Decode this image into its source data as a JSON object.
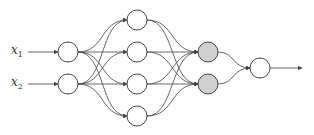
{
  "diagram": {
    "type": "neural-network",
    "inputs": [
      {
        "var": "x",
        "sub": "1"
      },
      {
        "var": "x",
        "sub": "2"
      }
    ],
    "layers": [
      {
        "name": "input",
        "count": 2,
        "fill": "#ffffff"
      },
      {
        "name": "hidden-1",
        "count": 4,
        "fill": "#ffffff"
      },
      {
        "name": "hidden-2",
        "count": 2,
        "fill": "#d0d0d0"
      },
      {
        "name": "output",
        "count": 1,
        "fill": "#ffffff"
      }
    ],
    "colors": {
      "stroke": "#444444",
      "highlight": "#d0d0d0"
    }
  }
}
